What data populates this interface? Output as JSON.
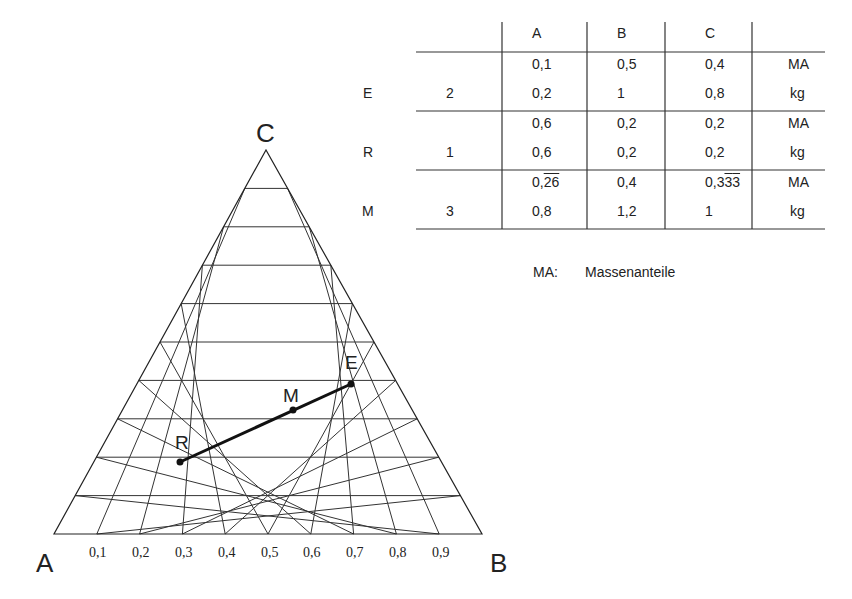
{
  "diagram": {
    "type": "ternary-diagram",
    "vertices": {
      "left": "A",
      "right": "B",
      "top": "C"
    },
    "grid_divisions": 10,
    "axis_ticks": [
      "0,1",
      "0,2",
      "0,3",
      "0,4",
      "0,5",
      "0,6",
      "0,7",
      "0,8",
      "0,9"
    ],
    "points": [
      {
        "label": "R",
        "A": 0.6,
        "B": 0.2,
        "C": 0.2
      },
      {
        "label": "M",
        "A": 0.266,
        "B": 0.4,
        "C": 0.333
      },
      {
        "label": "E",
        "A": 0.1,
        "B": 0.5,
        "C": 0.4
      }
    ],
    "line": {
      "from": "R",
      "to": "E",
      "through": "M"
    }
  },
  "table": {
    "headers": [
      "",
      "",
      "A",
      "B",
      "C",
      ""
    ],
    "rows": [
      {
        "stream": "E",
        "mass": "2",
        "ma": [
          "0,1",
          "0,5",
          "0,4"
        ],
        "ma_unit": "MA",
        "kg": [
          "0,2",
          "1",
          "0,8"
        ],
        "kg_unit": "kg"
      },
      {
        "stream": "R",
        "mass": "1",
        "ma": [
          "0,6",
          "0,2",
          "0,2"
        ],
        "ma_unit": "MA",
        "kg": [
          "0,6",
          "0,2",
          "0,2"
        ],
        "kg_unit": "kg"
      },
      {
        "stream": "M",
        "mass": "3",
        "ma_prefix": [
          "0,",
          "0,4",
          "0,3"
        ],
        "ma_over": [
          "26",
          "",
          "3"
        ],
        "ma": [
          "0,26 (repeating 26)",
          "0,4",
          "0,33 (repeating 3)"
        ],
        "ma_unit": "MA",
        "kg": [
          "0,8",
          "1,2",
          "1"
        ],
        "kg_unit": "kg"
      }
    ]
  },
  "legend": {
    "abbr": "MA:",
    "text": "Massenanteile"
  }
}
